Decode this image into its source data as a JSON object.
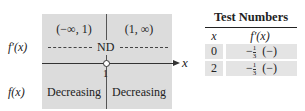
{
  "sign_chart": {
    "intervals": [
      "(−∞, 1)",
      "(1, ∞)"
    ],
    "derivative_label": "f′(x)",
    "function_label": "f(x)",
    "critical_marker": "ND",
    "critical_point": "1",
    "axis_label": "x",
    "behaviors": [
      "Decreasing",
      "Decreasing"
    ],
    "colors": {
      "panel": "#dcdcdc",
      "lines": "#333333"
    }
  },
  "test_table": {
    "title": "Test Numbers",
    "headers": [
      "x",
      "f′(x)"
    ],
    "rows": [
      {
        "x": "0",
        "num": "1",
        "den": "3",
        "neg": "−",
        "sign": "(−)"
      },
      {
        "x": "2",
        "num": "1",
        "den": "3",
        "neg": "−",
        "sign": "(−)"
      }
    ]
  }
}
